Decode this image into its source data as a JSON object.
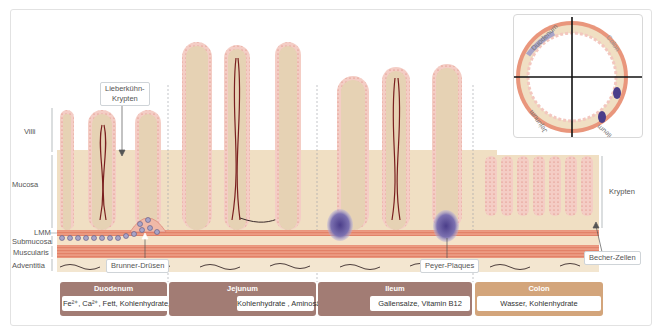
{
  "diagram": {
    "layer_labels": {
      "villi": "Villi",
      "mucosa": "Mucosa",
      "lmm": "LMM",
      "submucosa": "Submucosa",
      "muscularis": "Muscularis",
      "adventitia": "Adventitia"
    },
    "callouts": {
      "lieberkuehn_line1": "Lieberkühn-",
      "lieberkuehn_line2": "Krypten",
      "brunner": "Brunner-Drüsen",
      "peyer": "Peyer-Plaques",
      "becher": "Becher-Zellen",
      "krypten": "Krypten"
    },
    "sections": [
      {
        "name": "Duodenum",
        "absorbs": "Fe²⁺, Ca²⁺, Fett, Kohlenhydrate, Aminosäuren",
        "color": "#a27c74"
      },
      {
        "name": "Jejunum",
        "absorbs": "Kohlenhydrate , Aminosäuren",
        "color": "#a27c74"
      },
      {
        "name": "Ileum",
        "absorbs": "Gallensalze, Vitamin B12",
        "color": "#a27c74"
      },
      {
        "name": "Colon",
        "absorbs": "Wasser, Kohlenhydrate",
        "color": "#d3a57b"
      }
    ],
    "inset": {
      "quadrants": [
        "Duodenum",
        "Colon",
        "Jejunum",
        "Ileum"
      ]
    },
    "colors": {
      "villus_core": "#e6d2b4",
      "epithelium": "#f3c7bf",
      "muscle": "#e88a70",
      "submucosa": "#f5e3c9",
      "lymph": "#5a4a94",
      "vessel": "#7a1f1f"
    }
  }
}
